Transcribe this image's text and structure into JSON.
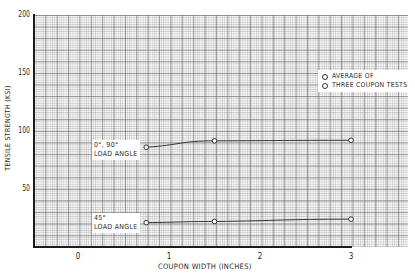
{
  "chart_data": {
    "type": "line",
    "title": "",
    "xlabel": "COUPON WIDTH (INCHES)",
    "ylabel": "TENSILE STRENGTH (KSI)",
    "xlim": [
      -0.5,
      3.6
    ],
    "ylim": [
      0,
      200
    ],
    "x_ticks": [
      "0",
      "1",
      "2",
      "3"
    ],
    "y_ticks": [
      "50",
      "100",
      "150",
      "200"
    ],
    "grid": true,
    "legend": {
      "position": "upper right",
      "marker": "open-circle",
      "lines": [
        "AVERAGE OF",
        "THREE COUPON TESTS"
      ]
    },
    "series": [
      {
        "name": "0°, 90° LOAD ANGLE",
        "label_lines": [
          "0°, 90°",
          "LOAD ANGLE"
        ],
        "x": [
          0.75,
          1.5,
          3.0
        ],
        "y": [
          86,
          91.5,
          92
        ]
      },
      {
        "name": "45° LOAD ANGLE",
        "label_lines": [
          "45°",
          "LOAD ANGLE"
        ],
        "x": [
          0.75,
          1.5,
          3.0
        ],
        "y": [
          21,
          22,
          24
        ]
      }
    ]
  }
}
